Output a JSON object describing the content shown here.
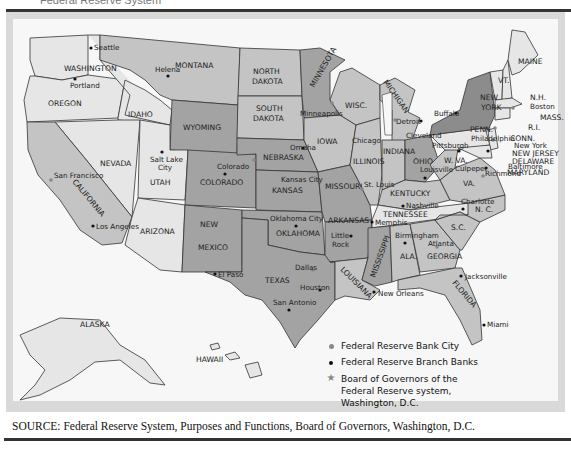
{
  "title_partial": "Federal Reserve System",
  "source": "SOURCE: Federal Reserve System, Purposes and Functions, Board of Governors, Washington, D.C.",
  "legend": [
    {
      "symbol": "gray-dot",
      "label": "Federal Reserve Bank City"
    },
    {
      "symbol": "black-dot",
      "label": "Federal Reserve Branch Banks"
    },
    {
      "symbol": "star",
      "label": "Board of Governors of the Federal Reserve system, Washington, D.C."
    }
  ],
  "colors": {
    "light": "#e6e6e6",
    "mid": "#c4c4c4",
    "dark": "#a3a3a3",
    "darker": "#8c8c8c",
    "water": "#f7f7f7"
  },
  "states": {
    "washington": "WASHINGTON",
    "oregon": "OREGON",
    "idaho": "IDAHO",
    "montana": "MONTANA",
    "wyoming": "WYOMING",
    "nevada": "NEVADA",
    "california": "CALIFORNIA",
    "utah": "UTAH",
    "colorado": "COLORADO",
    "arizona": "ARIZONA",
    "new_mexico_1": "NEW",
    "new_mexico_2": "MEXICO",
    "north_dakota_1": "NORTH",
    "north_dakota_2": "DAKOTA",
    "south_dakota_1": "SOUTH",
    "south_dakota_2": "DAKOTA",
    "nebraska": "NEBRASKA",
    "kansas": "KANSAS",
    "oklahoma": "OKLAHOMA",
    "texas": "TEXAS",
    "minnesota": "MINNESOTA",
    "iowa": "IOWA",
    "missouri": "MISSOURI",
    "arkansas": "ARKANSAS",
    "louisiana": "LOUISIANA",
    "wisconsin": "WISC.",
    "illinois": "ILLINOIS",
    "michigan": "MICHIGAN",
    "indiana": "INDIANA",
    "ohio": "OHIO",
    "kentucky": "KENTUCKY",
    "tennessee": "TENNESSEE",
    "mississippi": "MISSISSIPPI",
    "alabama": "ALA.",
    "georgia": "GEORGIA",
    "florida": "FLORIDA",
    "south_carolina": "S.C.",
    "north_carolina": "N. C.",
    "virginia": "VA.",
    "west_virginia": "W. VA.",
    "pennsylvania": "PENN.",
    "new_york_1": "NEW",
    "new_york_2": "YORK",
    "vermont": "VT.",
    "new_hampshire": "N.H.",
    "maine": "MAINE",
    "massachusetts": "MASS.",
    "rhode_island": "R.I.",
    "connecticut": "CONN.",
    "new_jersey": "NEW JERSEY",
    "delaware": "DELAWARE",
    "maryland": "MARYLAND",
    "alaska": "ALASKA",
    "hawaii": "HAWAII"
  },
  "cities": {
    "seattle": "Seattle",
    "portland": "Portland",
    "helena": "Helena",
    "salt_lake_1": "Salt Lake",
    "salt_lake_2": "City",
    "san_francisco": "San Francisco",
    "los_angeles": "Los Angeles",
    "denver": "Colorado",
    "el_paso": "El Paso",
    "omaha": "Omaha",
    "kansas_city": "Kansas City",
    "oklahoma_city": "Oklahoma City",
    "dallas": "Dallas",
    "houston": "Houston",
    "san_antonio": "San Antonio",
    "minneapolis": "Minneapolis",
    "chicago": "Chicago",
    "st_louis": "St. Louis",
    "little_rock_1": "Little",
    "little_rock_2": "Rock",
    "memphis": "Memphis",
    "new_orleans": "New Orleans",
    "detroit": "Detroit",
    "cleveland": "Cleveland",
    "louisville": "Louisville",
    "nashville": "Nashville",
    "birmingham": "Birmingham",
    "atlanta": "Atlanta",
    "jacksonville": "Jacksonville",
    "miami": "Miami",
    "pittsburgh": "Pittsburgh",
    "buffalo": "Buffalo",
    "boston": "Boston",
    "new_york": "New York",
    "philadelphia": "Philadelphia",
    "baltimore": "Baltimore",
    "richmond": "Richmond",
    "culpeper": "Culpeper",
    "charlotte": "Charlotte"
  }
}
